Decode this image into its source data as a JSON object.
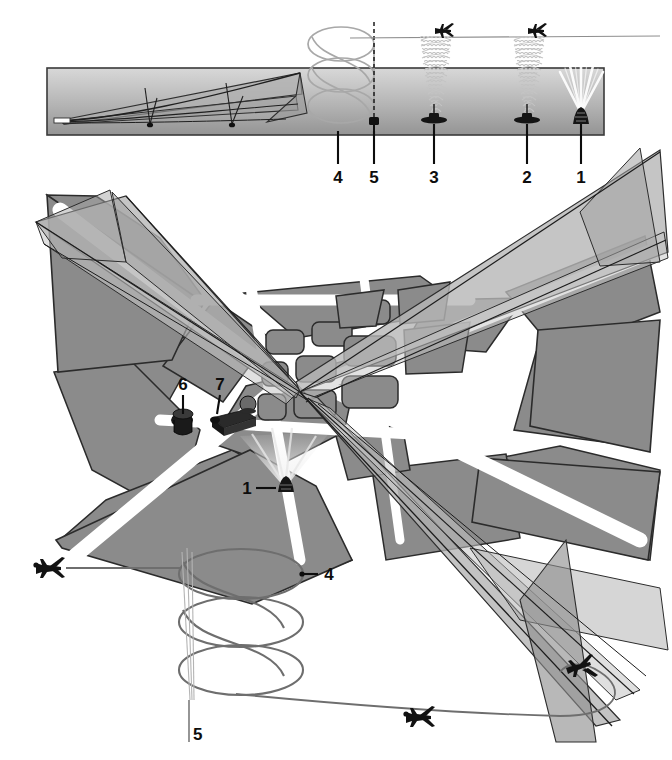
{
  "figure": {
    "type": "technical-diagram",
    "panels": [
      {
        "id": "elevation",
        "name": "side-elevation-view",
        "description": "Vertical profile band showing glide-slope / approach corridor at left, stacked holding pattern, and vertical radio beacon signal cones with overflying aircraft"
      },
      {
        "id": "plan",
        "name": "airport-plan-view",
        "description": "Oblique plan view of crossing runways, taxiways and apron blocks with intersecting approach corridors"
      },
      {
        "id": "pattern",
        "name": "holding-pattern-view",
        "description": "Plan view of stacked racetrack holding pattern with inbound and outbound aircraft tracks"
      }
    ],
    "callouts": [
      {
        "id": 1,
        "label": "1",
        "name": "surveillance-radar-beacon",
        "panels": [
          "elevation",
          "plan"
        ]
      },
      {
        "id": 2,
        "label": "2",
        "name": "radio-beacon-outer",
        "panels": [
          "elevation"
        ]
      },
      {
        "id": 3,
        "label": "3",
        "name": "radio-beacon-middle",
        "panels": [
          "elevation"
        ]
      },
      {
        "id": 4,
        "label": "4",
        "name": "holding-stack",
        "panels": [
          "elevation",
          "pattern"
        ]
      },
      {
        "id": 5,
        "label": "5",
        "name": "holding-fix-beacon",
        "panels": [
          "elevation",
          "pattern"
        ]
      },
      {
        "id": 6,
        "label": "6",
        "name": "dish-antenna",
        "panels": [
          "plan"
        ]
      },
      {
        "id": 7,
        "label": "7",
        "name": "radome-building",
        "panels": [
          "plan"
        ]
      }
    ],
    "elevation_labels": [
      {
        "label": "4",
        "x": 338,
        "y": 183,
        "tick_x": 338,
        "tick_top": 131,
        "tick_bottom": 164
      },
      {
        "label": "5",
        "x": 374,
        "y": 183,
        "tick_x": 374,
        "tick_top": 131,
        "tick_bottom": 164
      },
      {
        "label": "3",
        "x": 434,
        "y": 183,
        "tick_x": 434,
        "tick_top": 131,
        "tick_bottom": 164
      },
      {
        "label": "2",
        "x": 527,
        "y": 183,
        "tick_x": 527,
        "tick_top": 131,
        "tick_bottom": 164
      },
      {
        "label": "1",
        "x": 581,
        "y": 183,
        "tick_x": 581,
        "tick_top": 131,
        "tick_bottom": 164
      }
    ],
    "plan_labels": [
      {
        "label": "6",
        "x": 183,
        "y": 388
      },
      {
        "label": "7",
        "x": 220,
        "y": 388
      },
      {
        "label": "1",
        "x": 247,
        "y": 492
      }
    ],
    "pattern_labels": [
      {
        "label": "4",
        "x": 329,
        "y": 580
      },
      {
        "label": "5",
        "x": 193,
        "y": 735
      }
    ],
    "colors": {
      "ink": "#0d0d0d",
      "land_fill": "#8b8b8b",
      "land_stroke": "#2a2a2a",
      "band_top": "#d2d2d2",
      "band_bottom": "#9a9a9a",
      "cone_light": "#c9c9c9",
      "cone_mid": "#a9a9a9",
      "cone_dark": "#8f8f8f",
      "track": "#6e6e6e",
      "paper": "#ffffff"
    }
  }
}
